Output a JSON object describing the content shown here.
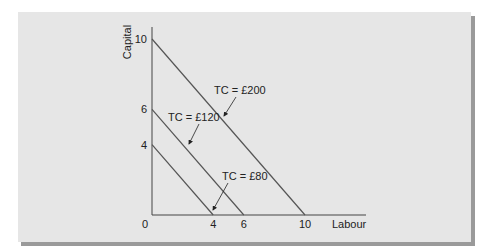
{
  "chart_data": {
    "type": "line",
    "title": "",
    "xlabel": "Labour",
    "ylabel": "Capital",
    "xlim": [
      0,
      10
    ],
    "ylim": [
      0,
      10
    ],
    "origin_label": "0",
    "x_ticks": [
      "4",
      "6",
      "10"
    ],
    "x_tick_values": [
      4,
      6,
      10
    ],
    "y_ticks": [
      "4",
      "6",
      "10"
    ],
    "y_tick_values": [
      4,
      6,
      10
    ],
    "grid": false,
    "line_color": "#555555",
    "series": [
      {
        "name": "TC = £80",
        "label": "TC = £80",
        "points": [
          [
            0,
            4
          ],
          [
            4,
            0
          ]
        ]
      },
      {
        "name": "TC = £120",
        "label": "TC = £120",
        "points": [
          [
            0,
            6
          ],
          [
            6,
            0
          ]
        ]
      },
      {
        "name": "TC = £200",
        "label": "TC = £200",
        "points": [
          [
            0,
            10
          ],
          [
            10,
            0
          ]
        ]
      }
    ]
  }
}
